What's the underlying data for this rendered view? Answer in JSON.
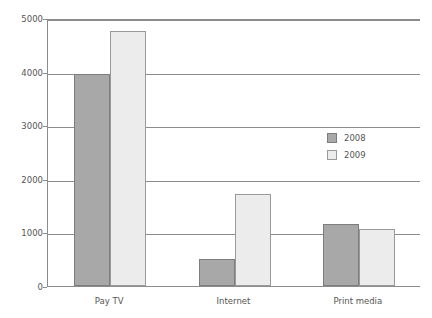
{
  "chart_data": {
    "type": "bar",
    "title": "",
    "xlabel": "",
    "ylabel": "",
    "categories": [
      "Pay TV",
      "Internet",
      "Print media"
    ],
    "series": [
      {
        "name": "2008",
        "color": "#a8a8a8",
        "values": [
          3950,
          500,
          1150
        ]
      },
      {
        "name": "2009",
        "color": "#ececec",
        "values": [
          4750,
          1720,
          1060
        ]
      }
    ],
    "ylim": [
      0,
      5000
    ],
    "yticks": [
      0,
      1000,
      2000,
      3000,
      4000,
      5000
    ],
    "ytick_labels": [
      "0",
      "1000",
      "2000",
      "3000",
      "4000",
      "5000"
    ],
    "grid": true,
    "legend_position": "inside-right"
  },
  "legend": {
    "entries": [
      {
        "label": "2008"
      },
      {
        "label": "2009"
      }
    ]
  },
  "colors": {
    "series_2008": "#a8a8a8",
    "series_2009": "#ececec",
    "axis": "#8c8c8c",
    "text": "#555555",
    "background": "#ffffff"
  }
}
